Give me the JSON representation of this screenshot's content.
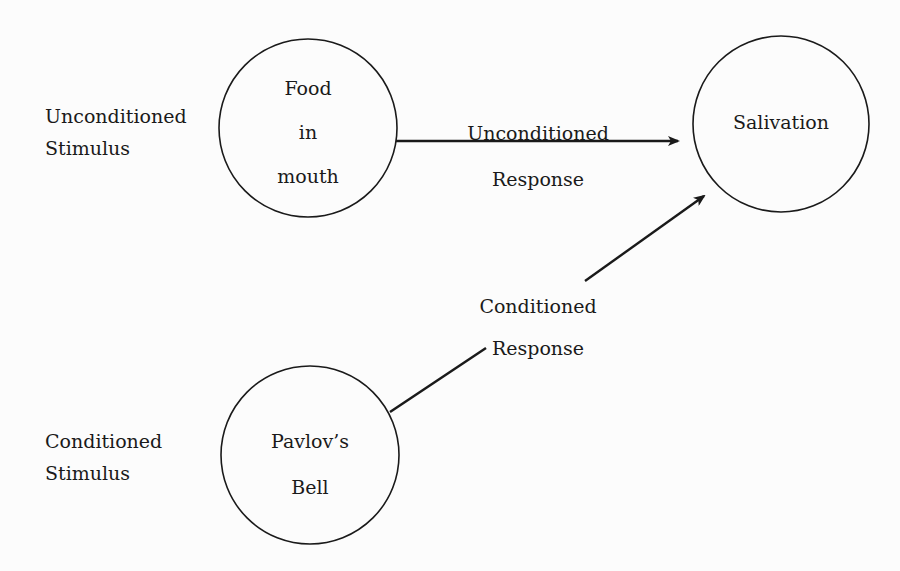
{
  "diagram": {
    "colors": {
      "stroke": "#1a1a1a",
      "background": "#fcfcfc"
    },
    "nodes": [
      {
        "id": "food",
        "lines": [
          "Food",
          "in",
          "mouth"
        ],
        "cx": 308,
        "cy": 128,
        "r": 89
      },
      {
        "id": "salivation",
        "lines": [
          "Salivation"
        ],
        "cx": 781,
        "cy": 124,
        "r": 88
      },
      {
        "id": "bell",
        "lines": [
          "Pavlov’s",
          "Bell"
        ],
        "cx": 310,
        "cy": 455,
        "r": 89
      }
    ],
    "side_labels": {
      "unconditioned_stimulus": [
        "Unconditioned",
        "Stimulus"
      ],
      "conditioned_stimulus": [
        "Conditioned",
        "Stimulus"
      ]
    },
    "edges": [
      {
        "from": "food",
        "to": "salivation",
        "label": [
          "Unconditioned",
          "Response"
        ]
      },
      {
        "from": "bell",
        "to": "salivation",
        "label": [
          "Conditioned",
          "Response"
        ]
      }
    ]
  }
}
